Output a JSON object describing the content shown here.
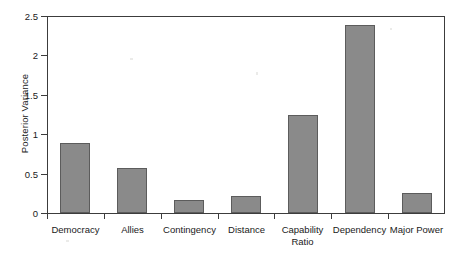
{
  "chart_data": {
    "type": "bar",
    "title": "",
    "subtitle": "",
    "xlabel": "",
    "ylabel": "Posterior Variance",
    "categories": [
      "Democracy",
      "Allies",
      "Contingency",
      "Distance",
      "Capability\nRatio",
      "Dependency",
      "Major Power"
    ],
    "values": [
      0.89,
      0.57,
      0.17,
      0.22,
      1.24,
      2.38,
      0.25
    ],
    "ylim": [
      0,
      2.5
    ],
    "ytick_labels": [
      "0",
      "0.5",
      "1",
      "1.5",
      "2",
      "2.5"
    ],
    "ytick_values": [
      0,
      0.5,
      1,
      1.5,
      2,
      2.5
    ],
    "grid": false,
    "legend": null,
    "legend_position": "none",
    "bar_color": "#8a8a8a",
    "bar_edge_color": "#5c5c5c",
    "axis_color": "#3c3c3c",
    "background_color": "#ffffff",
    "annotations": []
  }
}
